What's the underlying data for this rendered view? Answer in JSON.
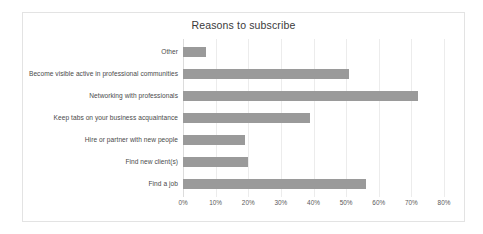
{
  "chart_data": {
    "type": "bar",
    "orientation": "horizontal",
    "title": "Reasons to subscribe",
    "xlabel": "",
    "ylabel": "",
    "xlim": [
      0,
      80
    ],
    "xtick_labels": [
      "0%",
      "10%",
      "20%",
      "30%",
      "40%",
      "50%",
      "60%",
      "70%",
      "80%"
    ],
    "xtick_values": [
      0,
      10,
      20,
      30,
      40,
      50,
      60,
      70,
      80
    ],
    "grid": true,
    "legend": "none",
    "bar_color": "#9a9a9a",
    "categories": [
      "Other",
      "Become visible active in professional communities",
      "Networking with professionals",
      "Keep tabs on your business acquaintance",
      "Hire or partner with new people",
      "Find new client(s)",
      "Find a job"
    ],
    "values": [
      7,
      51,
      72,
      39,
      19,
      20,
      56
    ],
    "bars": [
      {
        "label": "Other",
        "value": 7
      },
      {
        "label": "Become visible active in professional communities",
        "value": 51
      },
      {
        "label": "Networking with professionals",
        "value": 72
      },
      {
        "label": "Keep tabs on your business acquaintance",
        "value": 39
      },
      {
        "label": "Hire or partner with new people",
        "value": 19
      },
      {
        "label": "Find new client(s)",
        "value": 20
      },
      {
        "label": "Find a job",
        "value": 56
      }
    ]
  }
}
